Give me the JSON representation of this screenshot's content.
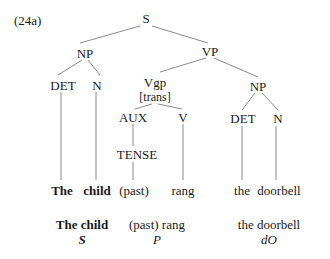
{
  "example_number": "(24a)",
  "tree": {
    "root": "S",
    "np_subject": "NP",
    "vp": "VP",
    "det_subject": "DET",
    "n_subject": "N",
    "vgp": "Vgp",
    "vgp_feature": "[trans]",
    "aux": "AUX",
    "v": "V",
    "tense": "TENSE",
    "np_object": "NP",
    "det_object": "DET",
    "n_object": "N"
  },
  "words": {
    "the_subject": "The",
    "child": "child",
    "past": "(past)",
    "rang": "rang",
    "the_object": "the",
    "doorbell": "doorbell"
  },
  "functions": [
    {
      "phrase": "The child",
      "role": "S"
    },
    {
      "phrase": "(past) rang",
      "role": "P"
    },
    {
      "phrase": "the doorbell",
      "role": "dO"
    }
  ]
}
